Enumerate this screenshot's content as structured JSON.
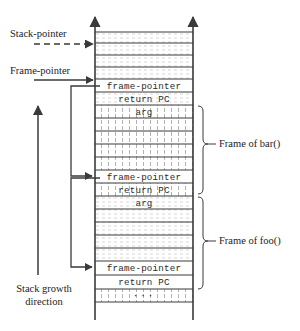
{
  "diagram": {
    "colors": {
      "line": "#3a3a3a",
      "text": "#1c1c1c",
      "hatch": "#9a9a9a",
      "background": "#ffffff"
    },
    "left_labels": [
      {
        "name": "stack-pointer",
        "text": "Stack-pointer",
        "arrow": "dashed"
      },
      {
        "name": "frame-pointer",
        "text": "Frame-pointer",
        "arrow": "solid"
      }
    ],
    "growth_label": {
      "line1": "Stack growth",
      "line2": "direction"
    },
    "right_labels": [
      {
        "name": "frame-of-bar",
        "text": "Frame of bar()"
      },
      {
        "name": "frame-of-foo",
        "text": "Frame of foo()"
      }
    ],
    "cells": [
      {
        "id": "c0",
        "text": "",
        "fill": "horiz"
      },
      {
        "id": "c1",
        "text": "",
        "fill": "horiz"
      },
      {
        "id": "c2",
        "text": "",
        "fill": "horiz"
      },
      {
        "id": "c3",
        "text": "frame-pointer",
        "fill": "plain"
      },
      {
        "id": "c4",
        "text": "return PC",
        "fill": "horiz"
      },
      {
        "id": "c5",
        "text": "arg",
        "fill": "vert"
      },
      {
        "id": "c6",
        "text": "",
        "fill": "vert"
      },
      {
        "id": "c7",
        "text": "",
        "fill": "vert"
      },
      {
        "id": "c8",
        "text": "",
        "fill": "vert"
      },
      {
        "id": "c9",
        "text": "frame-pointer",
        "fill": "plain"
      },
      {
        "id": "c10",
        "text": "return PC",
        "fill": "vert"
      },
      {
        "id": "c11",
        "text": "arg",
        "fill": "horiz"
      },
      {
        "id": "c12",
        "text": "",
        "fill": "horiz"
      },
      {
        "id": "c13",
        "text": "",
        "fill": "horiz"
      },
      {
        "id": "c14",
        "text": "",
        "fill": "horiz"
      },
      {
        "id": "c15",
        "text": "frame-pointer",
        "fill": "plain"
      },
      {
        "id": "c16",
        "text": "return PC",
        "fill": "plain"
      },
      {
        "id": "c17",
        "text": "···",
        "fill": "vert"
      }
    ]
  }
}
